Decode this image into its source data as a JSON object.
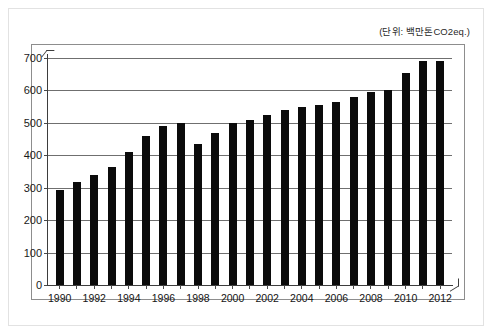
{
  "caption": {
    "unit_note": "(단위: 백만톤CO2eq.)"
  },
  "chart_data": {
    "type": "bar",
    "title": "",
    "subtitle": "",
    "xlabel": "",
    "ylabel": "",
    "unit_note": "(단위: 백만톤CO2eq.)",
    "ylim": [
      0,
      700
    ],
    "ytick_values": [
      0,
      100,
      200,
      300,
      400,
      500,
      600,
      700
    ],
    "ytick_labels": [
      "0",
      "100",
      "200",
      "300",
      "400",
      "500",
      "600",
      "700"
    ],
    "grid": true,
    "legend": false,
    "bar_color": "#0b0b0b",
    "gridline_color": "#6f6f6f",
    "axis_color": "#3d3d3d",
    "categories": [
      "1990",
      "1991",
      "1992",
      "1993",
      "1994",
      "1995",
      "1996",
      "1997",
      "1998",
      "1999",
      "2000",
      "2001",
      "2002",
      "2003",
      "2004",
      "2005",
      "2006",
      "2007",
      "2008",
      "2009",
      "2010",
      "2011",
      "2012"
    ],
    "xtick_labels_shown": [
      "1990",
      "",
      "1992",
      "",
      "1994",
      "",
      "1996",
      "",
      "1998",
      "",
      "2000",
      "",
      "2002",
      "",
      "2004",
      "",
      "2006",
      "",
      "2008",
      "",
      "2010",
      "",
      "2012"
    ],
    "values": [
      292,
      318,
      340,
      365,
      410,
      460,
      490,
      500,
      435,
      470,
      500,
      510,
      525,
      540,
      550,
      555,
      565,
      580,
      595,
      600,
      655,
      690,
      690
    ],
    "values_label": "Greenhouse gas emissions (million tons CO2eq.)"
  }
}
